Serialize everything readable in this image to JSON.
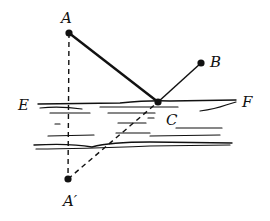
{
  "diagram": {
    "type": "geometry-reflection",
    "colors": {
      "ink": "#111111",
      "background": "#ffffff"
    },
    "points": {
      "A": {
        "label": "A",
        "x": 69,
        "y": 33
      },
      "B": {
        "label": "B",
        "x": 201,
        "y": 63
      },
      "C": {
        "label": "C",
        "x": 158,
        "y": 102
      },
      "A_prime": {
        "label": "A′",
        "x": 68,
        "y": 179
      }
    },
    "line_labels": {
      "E": "E",
      "F": "F"
    },
    "segments": [
      {
        "from": "A",
        "to": "C",
        "style": "solid-thick"
      },
      {
        "from": "C",
        "to": "B",
        "style": "solid"
      },
      {
        "from": "A",
        "to": "A_prime",
        "style": "dashed"
      },
      {
        "from": "A_prime",
        "to": "C",
        "style": "dashed"
      }
    ],
    "river": {
      "top_bank": "EF",
      "hatching": "water-lines"
    }
  }
}
